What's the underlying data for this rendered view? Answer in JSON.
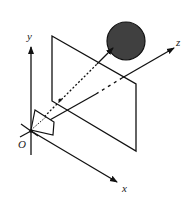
{
  "diagram": {
    "type": "camera-projection",
    "axes": {
      "x": {
        "label": "x"
      },
      "y": {
        "label": "y"
      },
      "z": {
        "label": "z"
      }
    },
    "origin": {
      "label": "O"
    },
    "elements": [
      "coordinate-axes",
      "image-plane",
      "sphere-object",
      "camera-frustum",
      "projection-ray"
    ],
    "colors": {
      "line": "#111111",
      "sphere_fill": "#404040",
      "background": "#ffffff"
    }
  }
}
